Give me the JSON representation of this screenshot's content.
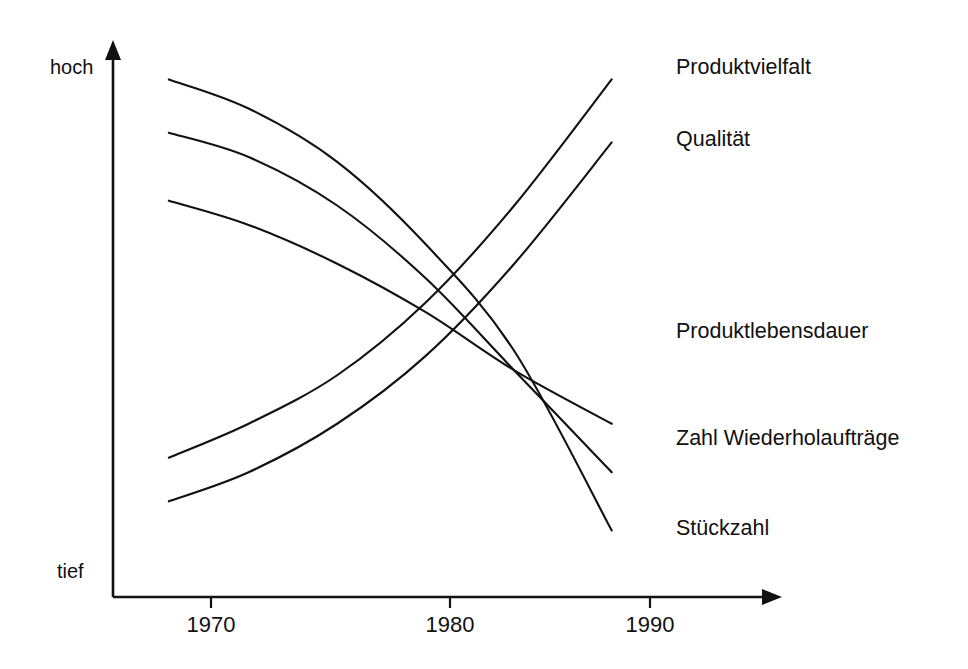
{
  "chart_data": {
    "type": "line",
    "title": "",
    "subtitle": "",
    "xlabel": "",
    "ylabel": "",
    "grid": false,
    "legend_position": "right-inline-labels",
    "axis_arrows": true,
    "x_tick_labels": [
      "1970",
      "1980",
      "1990"
    ],
    "x_tick_values": [
      1970,
      1980,
      1990
    ],
    "xlim": [
      1965,
      1993
    ],
    "y_axis_low_label": "tief",
    "y_axis_high_label": "hoch",
    "ylim": [
      0,
      100
    ],
    "series": [
      {
        "name": "Produktvielfalt",
        "direction": "increasing",
        "x": [
          1965.5,
          1970,
          1975,
          1980,
          1985,
          1990.5
        ],
        "values": [
          18,
          25,
          35,
          50,
          70,
          96
        ]
      },
      {
        "name": "Qualität",
        "direction": "increasing",
        "x": [
          1965.5,
          1970,
          1975,
          1980,
          1985,
          1990.5
        ],
        "values": [
          9,
          15,
          25,
          39,
          58,
          83
        ]
      },
      {
        "name": "Produktlebensdauer",
        "direction": "decreasing",
        "x": [
          1965.5,
          1970,
          1975,
          1980,
          1985,
          1990.5
        ],
        "values": [
          71,
          66,
          58,
          48,
          36,
          25
        ]
      },
      {
        "name": "Zahl Wiederholaufträge",
        "direction": "decreasing",
        "x": [
          1965.5,
          1970,
          1975,
          1980,
          1985,
          1990.5
        ],
        "values": [
          85,
          80,
          70,
          55,
          36,
          15
        ]
      },
      {
        "name": "Stückzahl",
        "direction": "decreasing",
        "x": [
          1965.5,
          1970,
          1975,
          1980,
          1985,
          1990.5
        ],
        "values": [
          96,
          90,
          79,
          62,
          40,
          3
        ]
      }
    ],
    "colors": {
      "line": "#111111",
      "axis": "#111111",
      "background": "#ffffff"
    }
  },
  "labels": {
    "axis_high": "hoch",
    "axis_low": "tief",
    "tick_1970": "1970",
    "tick_1980": "1980",
    "tick_1990": "1990",
    "series_produktvielfalt": "Produktvielfalt",
    "series_qualitaet": "Qualität",
    "series_produktlebensdauer": "Produktlebensdauer",
    "series_wiederholauftraege": "Zahl Wiederholaufträge",
    "series_stueckzahl": "Stückzahl"
  }
}
